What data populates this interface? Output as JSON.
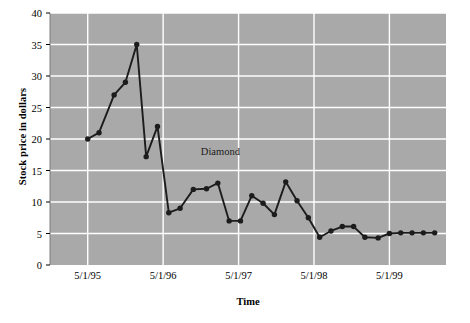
{
  "chart_data": {
    "type": "line",
    "title": "",
    "xlabel": "Time",
    "ylabel": "Stock price in dollars",
    "ylim": [
      0,
      40
    ],
    "ytick_labels": [
      "0",
      "5",
      "10",
      "15",
      "20",
      "25",
      "30",
      "35",
      "40"
    ],
    "ytick_values": [
      0,
      5,
      10,
      15,
      20,
      25,
      30,
      35,
      40
    ],
    "xtick_labels": [
      "5/1/95",
      "5/1/96",
      "5/1/97",
      "5/1/98",
      "5/1/99"
    ],
    "xtick_values": [
      2,
      6,
      10,
      14,
      18
    ],
    "xlim": [
      0,
      21
    ],
    "grid": true,
    "legend_position": "none",
    "plot_background": "#a9a9a9",
    "grid_color": "#ffffff",
    "series_color": "#1c1c1c",
    "marker": "circle",
    "annotations": [
      {
        "text": "Diamond",
        "x": 8.0,
        "y": 17.8
      }
    ],
    "series": [
      {
        "name": "Diamond",
        "x": [
          2.0,
          2.6,
          3.4,
          4.0,
          4.6,
          5.1,
          5.7,
          6.3,
          6.9,
          7.6,
          8.3,
          8.9,
          9.5,
          10.1,
          10.7,
          11.3,
          11.9,
          12.5,
          13.1,
          13.7,
          14.3,
          14.9,
          15.5,
          16.1,
          16.7,
          17.4,
          18.0,
          18.6,
          19.2,
          19.8,
          20.4
        ],
        "values": [
          20.0,
          21.0,
          27.0,
          29.0,
          35.0,
          17.2,
          22.0,
          8.3,
          9.0,
          12.0,
          12.1,
          13.0,
          7.0,
          7.0,
          11.0,
          9.8,
          8.0,
          13.2,
          10.2,
          7.5,
          4.4,
          5.4,
          6.1,
          6.1,
          4.4,
          4.3,
          5.0,
          5.1,
          5.1,
          5.1,
          5.1
        ]
      }
    ]
  }
}
